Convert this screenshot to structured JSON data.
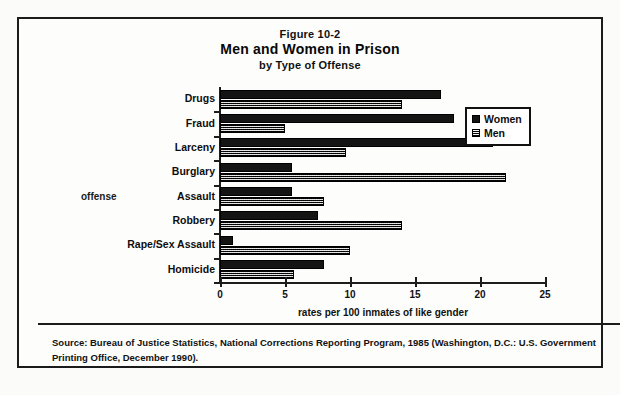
{
  "figure": {
    "number": "Figure 10-2",
    "title": "Men and Women in Prison",
    "subtitle": "by Type of Offense"
  },
  "legend": {
    "items": [
      {
        "label": "Women",
        "swatch": "solid-black-swatch"
      },
      {
        "label": "Men",
        "swatch": "hatched-gray-swatch"
      }
    ]
  },
  "axes": {
    "y_title": "offense",
    "x_title": "rates per 100 inmates of like gender",
    "x_ticks": [
      "0",
      "5",
      "10",
      "15",
      "20",
      "25"
    ]
  },
  "source": {
    "text": "Source: Bureau of Justice Statistics, National Corrections Reporting Program, 1985 (Washington, D.C.: U.S. Government Printing Office, December 1990)."
  },
  "chart_data": {
    "type": "bar",
    "orientation": "horizontal",
    "title": "Men and Women in Prison by Type of Offense",
    "subtitle": "by Type of Offense",
    "figure_number": "Figure 10-2",
    "xlabel": "rates per 100 inmates of like gender",
    "ylabel": "offense",
    "xlim": [
      0,
      25
    ],
    "xticks": [
      0,
      5,
      10,
      15,
      20,
      25
    ],
    "grid": false,
    "legend_position": "top-right",
    "categories": [
      "Drugs",
      "Fraud",
      "Larceny",
      "Burglary",
      "Assault",
      "Robbery",
      "Rape/Sex Assault",
      "Homicide"
    ],
    "series": [
      {
        "name": "Women",
        "fill": "solid-black",
        "color": "#141414",
        "values": [
          17.0,
          18.0,
          21.0,
          5.5,
          5.5,
          7.5,
          1.0,
          8.0
        ]
      },
      {
        "name": "Men",
        "fill": "checkered-hatch",
        "color": "#888888",
        "values": [
          14.0,
          5.0,
          9.7,
          22.0,
          8.0,
          14.0,
          10.0,
          5.7
        ]
      }
    ]
  }
}
